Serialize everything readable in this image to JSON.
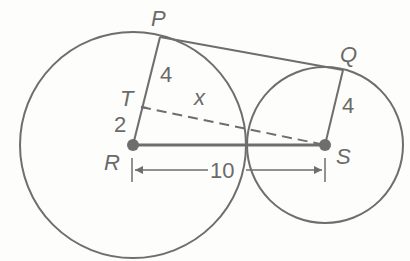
{
  "diagram": {
    "type": "two tangent-like circles with common external tangent",
    "points": {
      "P": {
        "label": "P",
        "x": 160,
        "y": 37
      },
      "Q": {
        "label": "Q",
        "x": 343,
        "y": 70
      },
      "T": {
        "label": "T",
        "x": 140,
        "y": 107
      },
      "R": {
        "label": "R",
        "x": 133,
        "y": 145
      },
      "S": {
        "label": "S",
        "x": 325,
        "y": 145
      }
    },
    "circles": [
      {
        "center": "R",
        "cx": 133,
        "cy": 145,
        "r": 113
      },
      {
        "center": "S",
        "cx": 325,
        "cy": 145,
        "r": 78
      }
    ],
    "segment_labels": {
      "PT": "4",
      "TR": "2",
      "QS": "4",
      "TS": "x",
      "RS": "10"
    },
    "colors": {
      "stroke": "#6e6e6e",
      "label": "#6a6a6a",
      "point": "#6e6e6e",
      "background": "#fdfdfb"
    }
  }
}
